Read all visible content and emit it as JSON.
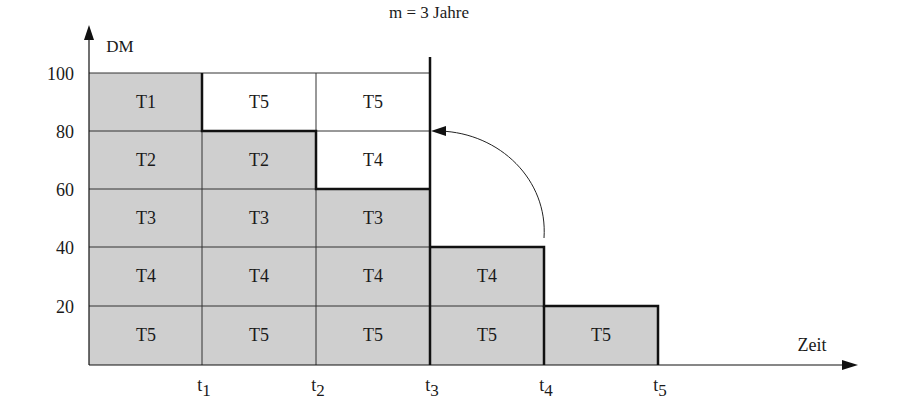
{
  "title": "m = 3 Jahre",
  "axes": {
    "y_label": "DM",
    "x_label": "Zeit",
    "y_ticks": [
      "100",
      "80",
      "60",
      "40",
      "20"
    ],
    "x_ticks": [
      {
        "base": "t",
        "sub": "1"
      },
      {
        "base": "t",
        "sub": "2"
      },
      {
        "base": "t",
        "sub": "3"
      },
      {
        "base": "t",
        "sub": "4"
      },
      {
        "base": "t",
        "sub": "5"
      }
    ]
  },
  "colors": {
    "fill_shaded": "#cfcfcf",
    "fill_white": "#ffffff",
    "line": "#1a1a1a"
  },
  "columns": [
    {
      "period": "0–t1",
      "cells": [
        {
          "label": "T1",
          "shaded": true
        },
        {
          "label": "T2",
          "shaded": true
        },
        {
          "label": "T3",
          "shaded": true
        },
        {
          "label": "T4",
          "shaded": true
        },
        {
          "label": "T5",
          "shaded": true
        }
      ]
    },
    {
      "period": "t1–t2",
      "cells": [
        {
          "label": "T5",
          "shaded": false
        },
        {
          "label": "T2",
          "shaded": true
        },
        {
          "label": "T3",
          "shaded": true
        },
        {
          "label": "T4",
          "shaded": true
        },
        {
          "label": "T5",
          "shaded": true
        }
      ]
    },
    {
      "period": "t2–t3",
      "cells": [
        {
          "label": "T5",
          "shaded": false
        },
        {
          "label": "T4",
          "shaded": false
        },
        {
          "label": "T3",
          "shaded": true
        },
        {
          "label": "T4",
          "shaded": true
        },
        {
          "label": "T5",
          "shaded": true
        }
      ]
    },
    {
      "period": "t3–t4",
      "cells": [
        {
          "label": "T4",
          "shaded": true
        },
        {
          "label": "T5",
          "shaded": true
        }
      ]
    },
    {
      "period": "t4–t5",
      "cells": [
        {
          "label": "T5",
          "shaded": true
        }
      ]
    }
  ],
  "annotation": {
    "arrow": "curved arrow from T4 block (t3–t4, 40 DM) back to 80 DM level at t3"
  }
}
